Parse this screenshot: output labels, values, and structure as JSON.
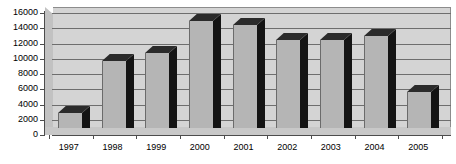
{
  "chart_data": {
    "type": "bar",
    "title": "",
    "subtitle": "",
    "xlabel": "",
    "ylabel": "",
    "categories": [
      "1997",
      "1998",
      "1999",
      "2000",
      "2001",
      "2002",
      "2003",
      "2004",
      "2005"
    ],
    "values": [
      2000,
      8800,
      9900,
      14000,
      13500,
      11600,
      11500,
      12100,
      4700
    ],
    "series": [
      {
        "name": "",
        "values": [
          2000,
          8800,
          9900,
          14000,
          13500,
          11600,
          11500,
          12100,
          4700
        ]
      }
    ],
    "ylim": [
      0,
      16000
    ],
    "yticks": [
      0,
      2000,
      4000,
      6000,
      8000,
      10000,
      12000,
      14000,
      16000
    ],
    "ytick_labels": [
      "0",
      "2000",
      "4000",
      "6000",
      "8000",
      "10000",
      "12000",
      "14000",
      "16000"
    ],
    "grid": true,
    "legend": false,
    "legend_position": "none",
    "style": "3d-column",
    "colors": {
      "bar_face": "#b5b5b5",
      "bar_side": "#141414",
      "bar_top": "#2b2b2b",
      "plot_background": "#d4d4d4",
      "gridline": "#6e6e6e",
      "axis": "#4c4c4c",
      "text": "#000000",
      "page_background": "#ffffff"
    }
  }
}
